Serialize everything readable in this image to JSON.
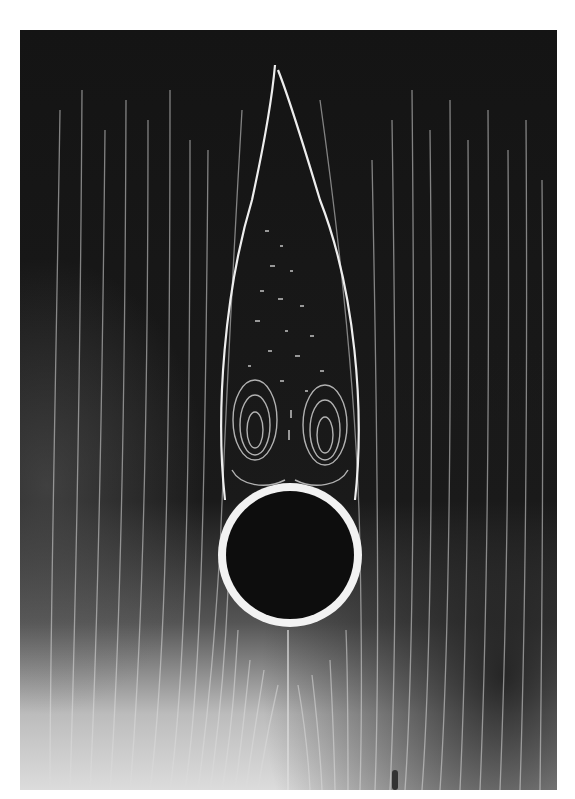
{
  "figure": {
    "colors": {
      "background_dark": "#141414",
      "background_light": "#d8d8d8",
      "streak": "#e6e6e6",
      "cylinder_fill": "#0d0d0d",
      "cylinder_rim": "#f2f2f2"
    },
    "cylinder": {
      "cx": 270,
      "cy": 525,
      "r": 72
    },
    "wake": {
      "tip_x": 255,
      "tip_y": 35,
      "vortex_count": 2
    }
  }
}
